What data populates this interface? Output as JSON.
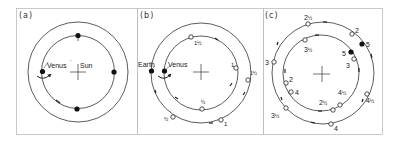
{
  "figure": {
    "panels": [
      {
        "id": "a",
        "label": "(a)",
        "objects": {
          "inner": "Venus",
          "center": "Sun"
        },
        "inner_quote": "\"",
        "inner_positions": [
          "top",
          "right",
          "bottom",
          "left"
        ]
      },
      {
        "id": "b",
        "label": "(b)",
        "objects": {
          "outer": "Earth",
          "inner": "Venus"
        },
        "inner_markers": [
          "1½",
          "1",
          "½"
        ],
        "outer_markers": [
          "1½",
          "1",
          "½"
        ]
      },
      {
        "id": "c",
        "label": "(c)",
        "outer_markers": [
          "2½",
          "2",
          "5",
          "4½",
          "4",
          "3½",
          "3"
        ],
        "inner_markers": [
          "3½",
          "5",
          "3",
          "2",
          "4",
          "2½",
          "4½"
        ]
      }
    ],
    "labels": {
      "a_venus": "Venus",
      "a_sun": "Sun",
      "b_earth": "Earth",
      "b_venus": "Venus",
      "b_in_1h": "1",
      "b_in_1": "1",
      "b_in_h": "½",
      "b_out_1h": "1",
      "b_out_1": "1",
      "b_out_h": "½",
      "half": "½",
      "c_o_2h": "2",
      "c_o_2": "2",
      "c_o_5": "5",
      "c_o_4h": "4",
      "c_o_4": "4",
      "c_o_3h": "3",
      "c_o_3": "3",
      "c_i_3h": "3",
      "c_i_5": "5",
      "c_i_3": "3",
      "c_i_2": "2",
      "c_i_4": "4",
      "c_i_2h": "2",
      "c_i_4h": "4"
    },
    "colors": {
      "line": "#333333",
      "border": "#bbbbbb",
      "background": "#ffffff"
    }
  }
}
